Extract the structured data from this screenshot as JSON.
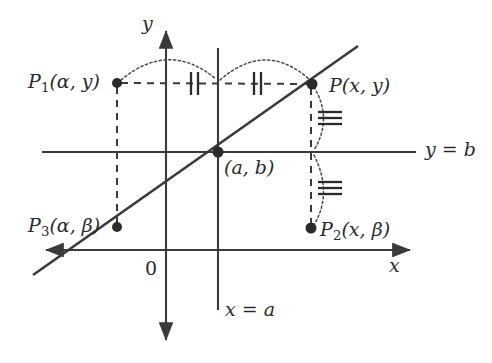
{
  "figure": {
    "background_color": "#ffffff",
    "ink_color": "#3a3a3a",
    "width": 492,
    "height": 363
  },
  "axes": {
    "x_axis_label": "x",
    "y_axis_label": "y",
    "origin_label": "0",
    "x_axis_y": 250,
    "y_axis_x": 166
  },
  "lines": [
    {
      "name": "horizontal-line-y-equals-b",
      "label": "y = b",
      "label_parts": {
        "lhs": "y",
        "eq": "=",
        "rhs": "b"
      },
      "y": 152
    },
    {
      "name": "vertical-line-x-equals-a",
      "label": "x = a",
      "label_parts": {
        "lhs": "x",
        "eq": "=",
        "rhs": "a"
      },
      "x": 218
    },
    {
      "name": "diagonal-line",
      "label": "",
      "description": "slanted line through (a, b)"
    }
  ],
  "points": [
    {
      "id": "P1",
      "name": "point-p1",
      "base": "P",
      "subscript": "1",
      "args": "(α, y)",
      "label": "P₁(α, y)",
      "x": 117,
      "y": 83
    },
    {
      "id": "P",
      "name": "point-p",
      "base": "P",
      "subscript": "",
      "args": "(x, y)",
      "label": "P(x, y)",
      "x": 312,
      "y": 84
    },
    {
      "id": "P3",
      "name": "point-p3",
      "base": "P",
      "subscript": "3",
      "args": "(α, β)",
      "label": "P₃(α, β)",
      "x": 117,
      "y": 227
    },
    {
      "id": "P2",
      "name": "point-p2",
      "base": "P",
      "subscript": "2",
      "args": "(x, β)",
      "label": "P₂(x, β)",
      "x": 311,
      "y": 228
    },
    {
      "id": "AB",
      "name": "point-a-b",
      "base": "",
      "subscript": "",
      "args": "(a, b)",
      "label": "(a, b)",
      "x": 218,
      "y": 152
    }
  ],
  "congruence_marks": {
    "horizontal_mark_count": 2,
    "horizontal_mark_glyph": "||",
    "vertical_mark_count": 3,
    "vertical_mark_glyph": "≡",
    "description": "double tick marks on horizontal segments, triple tick marks on vertical segments"
  },
  "arcs": {
    "count": 4,
    "description": "dotted arcs connecting congruent segments"
  }
}
